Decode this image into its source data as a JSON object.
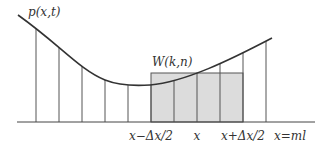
{
  "diagram": {
    "curve_label": "p(x,t)",
    "box_label": "W(k,n)",
    "axis_labels": [
      {
        "text": "x−Δx/2",
        "x": 151
      },
      {
        "text": "x",
        "x": 197
      },
      {
        "text": "x+Δx/2",
        "x": 243
      },
      {
        "text": "x=ml",
        "x": 290
      }
    ],
    "verticals_x": [
      36,
      59,
      82,
      105,
      128,
      151,
      174,
      197,
      220,
      243,
      266
    ],
    "shaded_box": {
      "x1": 151,
      "x2": 243,
      "top": 73
    },
    "colors": {
      "line": "#333333",
      "fill": "#dcdcdc",
      "thin": "#555555"
    }
  }
}
